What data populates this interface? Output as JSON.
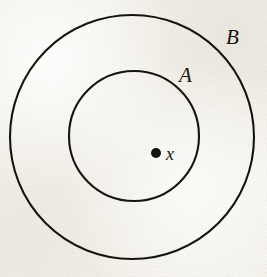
{
  "figure": {
    "kind": "nested-circles-diagram",
    "background_color": "#f4f2ec",
    "ink_color": "#16140f",
    "width": 267,
    "height": 277
  },
  "shapes": {
    "outer_circle": {
      "name": "B",
      "cx": 132,
      "cy": 137,
      "r": 122,
      "stroke": "#16140f",
      "stroke_width": 2.1,
      "fill": "none"
    },
    "inner_circle": {
      "name": "A",
      "cx": 134,
      "cy": 136,
      "r": 65,
      "stroke": "#16140f",
      "stroke_width": 2.1,
      "fill": "none"
    },
    "point": {
      "name": "x",
      "cx": 156,
      "cy": 153,
      "r": 5,
      "fill": "#16140f"
    }
  },
  "labels": {
    "outer": {
      "text": "B",
      "left": 226,
      "top": 27
    },
    "inner": {
      "text": "A",
      "left": 179,
      "top": 65
    },
    "point": {
      "text": "x",
      "left": 166,
      "top": 145
    }
  }
}
